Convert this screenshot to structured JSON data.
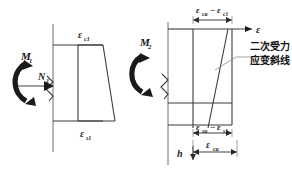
{
  "figure": {
    "background_color": "#ffffff",
    "line_color": "#6f6f6f",
    "dark_line_color": "#3b3b3b",
    "text_color": "#1a1a1a"
  },
  "left_diagram": {
    "name": "primary-loading-strain-diagram",
    "moment_label": "M",
    "moment_subscript": "1",
    "axial_label": "N",
    "axial_subscript": "1",
    "top_strain_label": "ε",
    "top_strain_subscript": "c1",
    "bottom_strain_label": "ε",
    "bottom_strain_subscript": "s1"
  },
  "right_diagram": {
    "name": "secondary-loading-strain-diagram",
    "moment_label": "M",
    "moment_subscript": "2",
    "axis_label": "ε",
    "top_dim_label": "ε",
    "top_dim_sub_a": "cu",
    "top_dim_minus": "−",
    "top_dim_label2": "ε",
    "top_dim_sub_b": "c1",
    "bottom_dim_label": "ε",
    "bottom_dim_sub_a": "su",
    "bottom_dim_minus": "−",
    "bottom_dim_label2": "ε",
    "bottom_dim_sub_b": "s1",
    "overall_dim_label": "ε",
    "overall_dim_sub": "cu",
    "height_label": "h",
    "annotation_line1": "二次受力",
    "annotation_line2": "应变斜线"
  }
}
